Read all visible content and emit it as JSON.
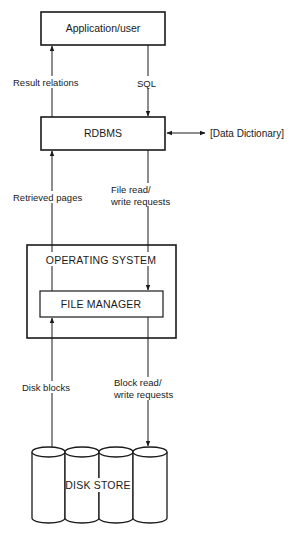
{
  "diagram": {
    "type": "layered-architecture",
    "nodes": {
      "application": {
        "label": "Application/user"
      },
      "rdbms": {
        "label": "RDBMS"
      },
      "operating_system": {
        "label": "OPERATING SYSTEM"
      },
      "file_manager": {
        "label": "FILE MANAGER"
      },
      "disk_store": {
        "label": "DISK STORE",
        "cylinder_count": 4
      },
      "data_dictionary": {
        "label": "[Data Dictionary]"
      }
    },
    "edges": {
      "result_relations": {
        "from": "RDBMS",
        "to": "Application/user",
        "label": "Result relations"
      },
      "sql": {
        "from": "Application/user",
        "to": "RDBMS",
        "label": "SQL"
      },
      "retrieved_pages": {
        "from": "FILE MANAGER",
        "to": "RDBMS",
        "label": "Retrieved pages"
      },
      "file_requests": {
        "from": "RDBMS",
        "to": "FILE MANAGER",
        "label_line1": "File read/",
        "label_line2": "write requests"
      },
      "disk_blocks": {
        "from": "DISK STORE",
        "to": "FILE MANAGER",
        "label": "Disk blocks"
      },
      "block_requests": {
        "from": "FILE MANAGER",
        "to": "DISK STORE",
        "label_line1": "Block read/",
        "label_line2": "write requests"
      },
      "dictionary_link": {
        "from": "RDBMS",
        "to": "[Data Dictionary]",
        "bidirectional": true
      }
    }
  }
}
